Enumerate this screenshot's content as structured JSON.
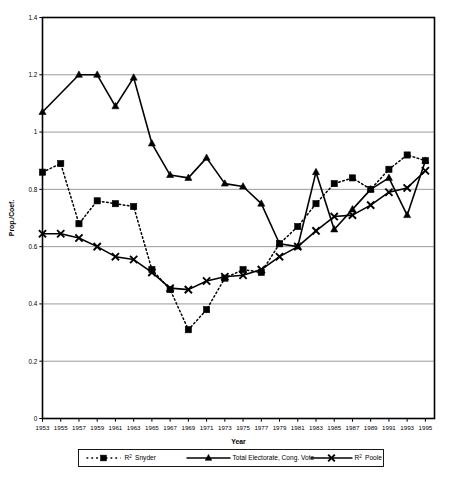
{
  "chart_data": {
    "type": "line",
    "title": "",
    "xlabel": "Year",
    "ylabel": "Prop./Coef.",
    "xlim": [
      1953,
      1996
    ],
    "ylim": [
      0,
      1.4
    ],
    "grid": true,
    "legend_position": "bottom",
    "ytick_labels": [
      "0",
      "0.2",
      "0.4",
      "0.6",
      "0.8",
      "1",
      "1.2",
      "1.4"
    ],
    "ytick_values": [
      0,
      0.2,
      0.4,
      0.6,
      0.8,
      1.0,
      1.2,
      1.4
    ],
    "xtick_labels": [
      "1953",
      "1955",
      "1957",
      "1959",
      "1961",
      "1963",
      "1965",
      "1967",
      "1969",
      "1971",
      "1973",
      "1975",
      "1977",
      "1979",
      "1981",
      "1983",
      "1985",
      "1987",
      "1989",
      "1991",
      "1993",
      "1995"
    ],
    "xtick_values": [
      1953,
      1955,
      1957,
      1959,
      1961,
      1963,
      1965,
      1967,
      1969,
      1971,
      1973,
      1975,
      1977,
      1979,
      1981,
      1983,
      1985,
      1987,
      1989,
      1991,
      1993,
      1995
    ],
    "series": [
      {
        "name": "R2 Snyder",
        "label": "R",
        "superscript": "2",
        "label_tail": "Snyder",
        "marker": "square",
        "line_style": "dashed",
        "color": "#000000",
        "x": [
          1953,
          1955,
          1957,
          1959,
          1961,
          1963,
          1965,
          1967,
          1969,
          1971,
          1973,
          1975,
          1977,
          1979,
          1981,
          1983,
          1985,
          1987,
          1989,
          1991,
          1993,
          1995
        ],
        "values": [
          0.86,
          0.89,
          0.68,
          0.76,
          0.75,
          0.74,
          0.52,
          0.45,
          0.31,
          0.38,
          0.49,
          0.52,
          0.51,
          0.61,
          0.67,
          0.75,
          0.82,
          0.84,
          0.8,
          0.87,
          0.92,
          0.9
        ]
      },
      {
        "name": "Total Electorate, Cong. Vote",
        "label": "Total Electorate, Cong. Vote",
        "marker": "triangle",
        "line_style": "solid",
        "color": "#000000",
        "x": [
          1953,
          1957,
          1959,
          1961,
          1963,
          1965,
          1967,
          1969,
          1971,
          1973,
          1975,
          1977,
          1979,
          1981,
          1983,
          1985,
          1987,
          1989,
          1991,
          1993,
          1995
        ],
        "values": [
          1.07,
          1.2,
          1.2,
          1.09,
          1.19,
          0.96,
          0.85,
          0.84,
          0.91,
          0.82,
          0.81,
          0.75,
          0.61,
          0.6,
          0.86,
          0.66,
          0.73,
          0.8,
          0.84,
          0.71,
          0.9
        ]
      },
      {
        "name": "R2 Poole",
        "label": "R",
        "superscript": "2",
        "label_tail": "Poole",
        "marker": "x",
        "line_style": "solid",
        "color": "#000000",
        "x": [
          1953,
          1955,
          1957,
          1959,
          1961,
          1963,
          1965,
          1967,
          1969,
          1971,
          1973,
          1975,
          1977,
          1979,
          1981,
          1983,
          1985,
          1987,
          1989,
          1991,
          1993,
          1995
        ],
        "values": [
          0.645,
          0.645,
          0.63,
          0.6,
          0.565,
          0.555,
          0.51,
          0.455,
          0.45,
          0.48,
          0.495,
          0.5,
          0.52,
          0.565,
          0.6,
          0.655,
          0.705,
          0.71,
          0.745,
          0.79,
          0.805,
          0.865
        ]
      }
    ]
  },
  "legend": {
    "items": [
      {
        "label": "R",
        "superscript": "2",
        "label_tail": "Snyder",
        "marker": "square",
        "line_style": "dashed"
      },
      {
        "label": "Total Electorate, Cong. Vote",
        "superscript": "",
        "label_tail": "",
        "marker": "triangle",
        "line_style": "solid"
      },
      {
        "label": "R",
        "superscript": "2",
        "label_tail": "Poole",
        "marker": "x",
        "line_style": "solid"
      }
    ]
  },
  "axes": {
    "x_title": "Year",
    "y_title": "Prop./Coef."
  },
  "colors": {
    "ink": "#000000",
    "grid": "#808080",
    "background": "#ffffff"
  }
}
